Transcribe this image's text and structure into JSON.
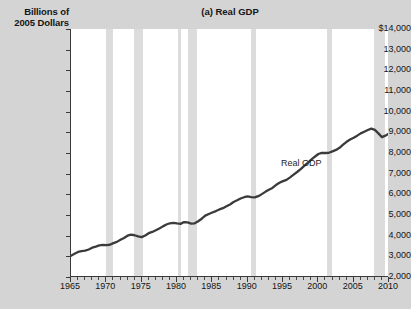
{
  "figure": {
    "title": "(a) Real GDP",
    "y_axis_title_line1": "Billions of",
    "y_axis_title_line2": "2005 Dollars",
    "series_annotation": "Real GDP",
    "colors": {
      "background": "#d4d4d4",
      "plot_background": "#ffffff",
      "recession_band": "#dcdcdc",
      "line": "#3b3b3b",
      "axis": "#3a3a3a",
      "text": "#141414"
    }
  },
  "chart_data": {
    "type": "line",
    "title": "(a) Real GDP",
    "xlabel": "",
    "ylabel": "Billions of 2005 Dollars",
    "xlim": [
      1965,
      2010
    ],
    "ylim": [
      2000,
      14000
    ],
    "grid": false,
    "legend_position": "inline-annotation",
    "y_tick_labels": [
      "$14,000",
      "13,000",
      "12,000",
      "11,000",
      "10,000",
      "9,000",
      "8,000",
      "7,000",
      "6,000",
      "5,000",
      "4,000",
      "3,000",
      "2,000"
    ],
    "y_tick_values": [
      14000,
      13000,
      12000,
      11000,
      10000,
      9000,
      8000,
      7000,
      6000,
      5000,
      4000,
      3000,
      2000
    ],
    "x_tick_labels": [
      "1965",
      "1970",
      "1975",
      "1980",
      "1985",
      "1990",
      "1995",
      "2000",
      "2005",
      "2010"
    ],
    "x_tick_values": [
      1965,
      1970,
      1975,
      1980,
      1985,
      1990,
      1995,
      2000,
      2005,
      2010
    ],
    "x_minor_tick_step": 1,
    "series": [
      {
        "name": "Real GDP",
        "x": [
          1965.0,
          1965.5,
          1966.0,
          1966.5,
          1967.0,
          1967.5,
          1968.0,
          1968.5,
          1969.0,
          1969.5,
          1970.0,
          1970.5,
          1971.0,
          1971.5,
          1972.0,
          1972.5,
          1973.0,
          1973.5,
          1974.0,
          1974.5,
          1975.0,
          1975.5,
          1976.0,
          1976.5,
          1977.0,
          1977.5,
          1978.0,
          1978.5,
          1979.0,
          1979.5,
          1980.0,
          1980.5,
          1981.0,
          1981.5,
          1982.0,
          1982.5,
          1983.0,
          1983.5,
          1984.0,
          1984.5,
          1985.0,
          1985.5,
          1986.0,
          1986.5,
          1987.0,
          1987.5,
          1988.0,
          1988.5,
          1989.0,
          1989.5,
          1990.0,
          1990.5,
          1991.0,
          1991.5,
          1992.0,
          1992.5,
          1993.0,
          1993.5,
          1994.0,
          1994.5,
          1995.0,
          1995.5,
          1996.0,
          1996.5,
          1997.0,
          1997.5,
          1998.0,
          1998.5,
          1999.0,
          1999.5,
          2000.0,
          2000.5,
          2001.0,
          2001.5,
          2002.0,
          2002.5,
          2003.0,
          2003.5,
          2004.0,
          2004.5,
          2005.0,
          2005.5,
          2006.0,
          2006.5,
          2007.0,
          2007.5,
          2008.0,
          2008.5,
          2009.0,
          2009.5,
          2010.0
        ],
        "values": [
          3030,
          3120,
          3210,
          3250,
          3280,
          3330,
          3420,
          3470,
          3530,
          3550,
          3540,
          3560,
          3640,
          3700,
          3800,
          3890,
          4000,
          4050,
          4020,
          3970,
          3930,
          4010,
          4120,
          4180,
          4260,
          4350,
          4450,
          4540,
          4600,
          4620,
          4590,
          4570,
          4660,
          4640,
          4580,
          4600,
          4700,
          4820,
          4970,
          5050,
          5120,
          5190,
          5270,
          5330,
          5420,
          5510,
          5630,
          5710,
          5800,
          5860,
          5900,
          5870,
          5850,
          5910,
          6010,
          6120,
          6220,
          6310,
          6450,
          6560,
          6640,
          6700,
          6820,
          6950,
          7080,
          7220,
          7380,
          7520,
          7680,
          7820,
          7950,
          8010,
          8000,
          8010,
          8080,
          8150,
          8250,
          8400,
          8540,
          8650,
          8740,
          8840,
          8950,
          9030,
          9110,
          9180,
          9120,
          8950,
          8770,
          8840,
          8950
        ],
        "units": "Billions of 2005 Dollars",
        "note": "Values shown on chart scale from about 3,000 in 1965 rising to a peak near 13,400 in 2007-2008, dipping to about 12,700 in 2009, then recovering to about 13,300 in 2010."
      }
    ],
    "recession_bands": [
      {
        "start": 1969.9,
        "end": 1970.9,
        "label": "1969-1970 recession"
      },
      {
        "start": 1973.9,
        "end": 1975.2,
        "label": "1973-1975 recession"
      },
      {
        "start": 1980.1,
        "end": 1980.6,
        "label": "1980 recession"
      },
      {
        "start": 1981.5,
        "end": 1982.9,
        "label": "1981-1982 recession"
      },
      {
        "start": 1990.5,
        "end": 1991.2,
        "label": "1990-1991 recession"
      },
      {
        "start": 2001.2,
        "end": 2001.9,
        "label": "2001 recession"
      },
      {
        "start": 2007.9,
        "end": 2009.5,
        "label": "2007-2009 recession"
      }
    ]
  }
}
